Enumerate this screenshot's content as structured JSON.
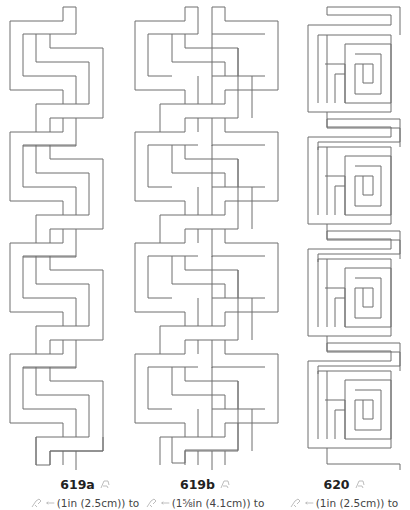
{
  "patterns": [
    {
      "id": "619a",
      "label": "619a",
      "size_text": "(1in (2.5cm)) to",
      "center_x": 58
    },
    {
      "id": "619b",
      "label": "619b",
      "size_text": "(1⅝in (4.1cm)) to",
      "center_x": 205
    },
    {
      "id": "620",
      "label": "620",
      "size_text": "(1in (2.5cm)) to",
      "center_x": 345
    }
  ],
  "icons": {
    "title_icon": "stitch-diagram-icon",
    "needle_icon": "hand-stitch-icon",
    "arrow_icon": "width-arrow-icon"
  },
  "colors": {
    "line": "#6e6e6e",
    "text": "#333333",
    "icon": "#b5b5b5"
  }
}
